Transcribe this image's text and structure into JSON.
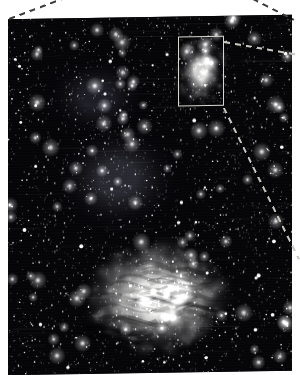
{
  "figure": {
    "kind": "astronomical-photograph",
    "background_color": "#ffffff",
    "caption_text": "",
    "photo": {
      "name": "starfield-photograph",
      "x": 8,
      "y": 17,
      "width": 284,
      "height": 356,
      "skew_deg": -0.9,
      "base_color": "#050508",
      "description_text": ""
    },
    "selection_box": {
      "name": "inset-selection-box",
      "x": 178,
      "y": 37,
      "width": 46,
      "height": 70,
      "border_color": "#d8d8d0",
      "border_width": 1,
      "label_text": ""
    },
    "callout_lines": [
      {
        "name": "callout-top-left",
        "x1": 9,
        "y1": 18,
        "x2": 62,
        "y2": -2,
        "color": "#3c3c3c"
      },
      {
        "name": "callout-top-right",
        "x1": 253,
        "y1": -2,
        "x2": 294,
        "y2": 19,
        "color": "#3c3c3c"
      },
      {
        "name": "callout-box-upper",
        "x1": 224,
        "y1": 41,
        "x2": 299,
        "y2": 54,
        "color": "#c8c8c0"
      },
      {
        "name": "callout-box-lower",
        "x1": 224,
        "y1": 107,
        "x2": 299,
        "y2": 258,
        "color": "#c8c8c0"
      }
    ],
    "nebulae": [
      {
        "name": "nebula-lagoon-main",
        "x": 158,
        "y": 297,
        "rx": 78,
        "ry": 58,
        "peak": "#f2f2ee",
        "label_text": ""
      },
      {
        "name": "nebula-lagoon-core",
        "x": 178,
        "y": 290,
        "rx": 20,
        "ry": 17,
        "peak": "#ffffff",
        "label_text": ""
      },
      {
        "name": "nebula-inset-bright",
        "x": 201,
        "y": 72,
        "rx": 21,
        "ry": 28,
        "peak": "#e8e8e4",
        "label_text": ""
      },
      {
        "name": "nebula-diffuse-mid",
        "x": 118,
        "y": 178,
        "rx": 62,
        "ry": 54,
        "peak": "#2a2a30",
        "label_text": ""
      },
      {
        "name": "nebula-diffuse-upper",
        "x": 96,
        "y": 96,
        "rx": 50,
        "ry": 40,
        "peak": "#1c1c22",
        "label_text": ""
      }
    ],
    "star_field": {
      "name": "star-field",
      "seed": 20240817,
      "star_count": 2600,
      "bright_star_count": 90,
      "color": "#ffffff"
    }
  }
}
